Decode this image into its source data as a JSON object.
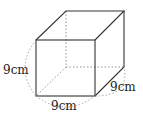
{
  "figure": {
    "type": "cube",
    "labels": {
      "height": "9cm",
      "width": "9cm",
      "depth": "9cm"
    },
    "colors": {
      "edge": "#333333",
      "hidden_edge": "#888888",
      "arc": "#999999",
      "text": "#222222"
    }
  }
}
